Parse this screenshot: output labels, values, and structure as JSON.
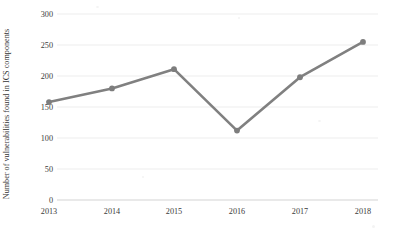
{
  "chart_data": {
    "type": "line",
    "title": "",
    "subtitle": "",
    "xlabel": "",
    "ylabel": "Number of vulnerabilities found in ICS components",
    "categories": [
      "2013",
      "2014",
      "2015",
      "2016",
      "2017",
      "2018"
    ],
    "x": [
      2013,
      2014,
      2015,
      2016,
      2017,
      2018
    ],
    "values": [
      158,
      180,
      211,
      112,
      198,
      255
    ],
    "series": [
      {
        "name": "Vulnerabilities in ICS components",
        "values": [
          158,
          180,
          211,
          112,
          198,
          255
        ]
      }
    ],
    "ylim": [
      0,
      300
    ],
    "yticks": [
      0,
      50,
      100,
      150,
      200,
      250,
      300
    ],
    "ytick_labels": [
      "0",
      "50",
      "100",
      "150",
      "200",
      "250",
      "300"
    ],
    "xtick_labels": [
      "2013",
      "2014",
      "2015",
      "2016",
      "2017",
      "2018"
    ],
    "grid": true,
    "grid_axis": "y",
    "legend": false,
    "legend_position": "none",
    "marker": "circle",
    "line_color": "#808080",
    "marker_color": "#7d7d7d",
    "grid_color": "#e8e8e8",
    "axis_color": "#d9d9d9",
    "background_color": "#ffffff",
    "text_color": "#3a3a3a"
  },
  "axis": {
    "y_title": "Number of vulnerabilities found in ICS components",
    "y_ticks": [
      "300",
      "250",
      "200",
      "150",
      "100",
      "50",
      "0"
    ],
    "x_ticks": [
      "2013",
      "2014",
      "2015",
      "2016",
      "2017",
      "2018"
    ]
  }
}
